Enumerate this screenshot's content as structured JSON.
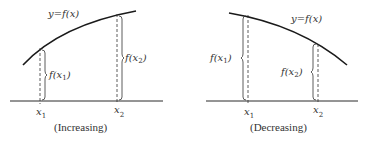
{
  "panels": [
    {
      "id": "increasing",
      "curve_label": "y=f(x)",
      "value_labels": {
        "f1_main": "f(x",
        "f1_sub": "1",
        "f1_end": ")",
        "f2_main": "f(x",
        "f2_sub": "2",
        "f2_end": ")"
      },
      "x_labels": {
        "x1_main": "x",
        "x1_sub": "1",
        "x2_main": "x",
        "x2_sub": "2"
      },
      "caption": "(Increasing)"
    },
    {
      "id": "decreasing",
      "curve_label": "y=f(x)",
      "value_labels": {
        "f1_main": "f(x",
        "f1_sub": "1",
        "f1_end": ")",
        "f2_main": "f(x",
        "f2_sub": "2",
        "f2_end": ")"
      },
      "x_labels": {
        "x1_main": "x",
        "x1_sub": "1",
        "x2_main": "x",
        "x2_sub": "2"
      },
      "caption": "(Decreasing)"
    }
  ],
  "colors": {
    "line": "#1a1a1a",
    "text": "#333333",
    "background": "#ffffff"
  }
}
